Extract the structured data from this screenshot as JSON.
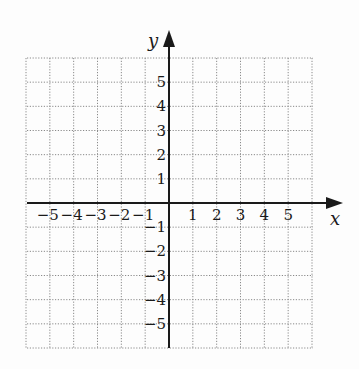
{
  "chart_data": {
    "type": "scatter",
    "title": "",
    "xlabel": "x",
    "ylabel": "y",
    "xlim": [
      -6,
      6
    ],
    "ylim": [
      -6,
      6
    ],
    "grid": true,
    "grid_style": "dotted",
    "x_ticks": [
      -5,
      -4,
      -3,
      -2,
      -1,
      1,
      2,
      3,
      4,
      5
    ],
    "y_ticks": [
      5,
      4,
      3,
      2,
      1,
      -1,
      -2,
      -3,
      -4,
      -5
    ],
    "x_tick_labels": [
      "−5",
      "−4",
      "−3",
      "−2",
      "−1",
      "1",
      "2",
      "3",
      "4",
      "5"
    ],
    "y_tick_labels": [
      "5",
      "4",
      "3",
      "2",
      "1",
      "−1",
      "−2",
      "−3",
      "−4",
      "−5"
    ],
    "series": [],
    "colors": {
      "axis": "#1a1a1a",
      "grid": "#8a8a8a",
      "background": "#fdfdfd"
    }
  },
  "axes": {
    "x_label": "x",
    "y_label": "y"
  }
}
